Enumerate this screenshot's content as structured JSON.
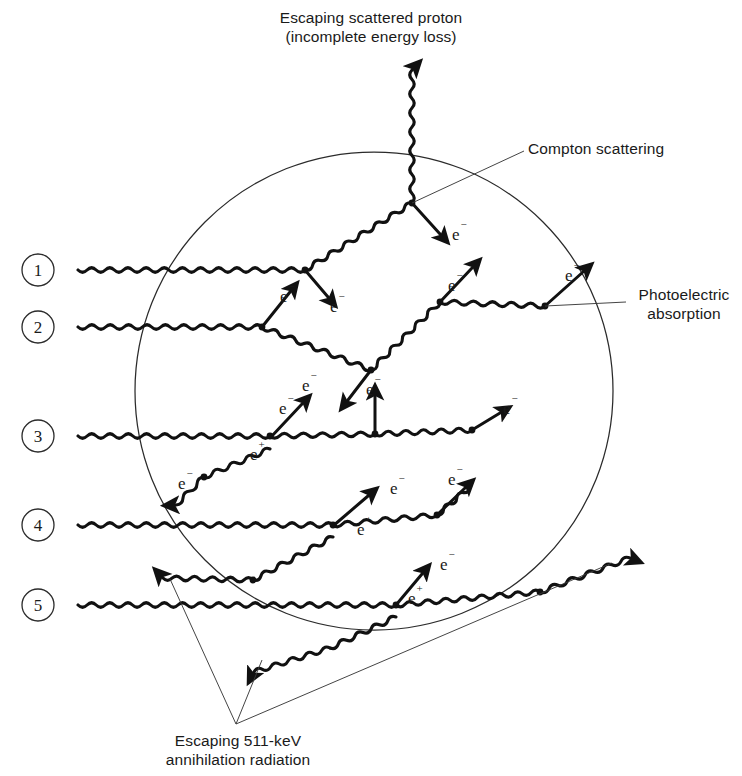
{
  "figure": {
    "detector_shape": "circle",
    "background_color": "#ffffff",
    "ink_color": "#111111"
  },
  "captions": {
    "top": "Escaping scattered proton\n(incomplete energy loss)",
    "compton": "Compton scattering",
    "photoelectric": "Photoelectric\nabsorption",
    "bottom": "Escaping 511-keV\nannihilation radiation"
  },
  "event_numbers": [
    {
      "label": "1",
      "cx": 38,
      "cy": 270
    },
    {
      "label": "2",
      "cx": 38,
      "cy": 327
    },
    {
      "label": "3",
      "cx": 38,
      "cy": 436
    },
    {
      "label": "4",
      "cx": 38,
      "cy": 525
    },
    {
      "label": "5",
      "cx": 38,
      "cy": 605
    }
  ],
  "particle_labels": [
    {
      "text": "e",
      "sup": "−",
      "x": 280,
      "y": 302
    },
    {
      "text": "e",
      "sup": "−",
      "x": 330,
      "y": 312
    },
    {
      "text": "e",
      "sup": "−",
      "x": 452,
      "y": 240
    },
    {
      "text": "e",
      "sup": "−",
      "x": 448,
      "y": 291
    },
    {
      "text": "e",
      "sup": "−",
      "x": 565,
      "y": 281
    },
    {
      "text": "e",
      "sup": "−",
      "x": 302,
      "y": 391
    },
    {
      "text": "e",
      "sup": "−",
      "x": 366,
      "y": 395
    },
    {
      "text": "e",
      "sup": "−",
      "x": 279,
      "y": 414
    },
    {
      "text": "e",
      "sup": "+",
      "x": 250,
      "y": 460
    },
    {
      "text": "e",
      "sup": "−",
      "x": 178,
      "y": 489
    },
    {
      "text": "e",
      "sup": "−",
      "x": 503,
      "y": 414
    },
    {
      "text": "e",
      "sup": "−",
      "x": 390,
      "y": 494
    },
    {
      "text": "e",
      "sup": "+",
      "x": 357,
      "y": 535
    },
    {
      "text": "e",
      "sup": "−",
      "x": 448,
      "y": 485
    },
    {
      "text": "e",
      "sup": "−",
      "x": 440,
      "y": 570
    },
    {
      "text": "e",
      "sup": "+",
      "x": 408,
      "y": 604
    }
  ],
  "detector": {
    "cx": 374,
    "cy": 391,
    "r": 239
  },
  "tracks": {
    "incident_photons": [
      {
        "row": 1,
        "x_start": 78,
        "y": 270,
        "x_end": 305
      },
      {
        "row": 2,
        "x_start": 78,
        "y": 327,
        "x_end": 262
      },
      {
        "row": 3,
        "x_start": 78,
        "y": 436,
        "x_end": 270
      },
      {
        "row": 4,
        "x_start": 78,
        "y": 525,
        "x_end": 333
      },
      {
        "row": 5,
        "x_start": 78,
        "y": 605,
        "x_end": 396
      }
    ],
    "escaping_scattered_photon": {
      "x": 412,
      "y_from": 202,
      "y_to": 70
    },
    "escaping_annihilation_left": {
      "to_x": 163,
      "to_y": 578
    },
    "escaping_annihilation_right": {
      "to_x": 620,
      "to_y": 560
    }
  }
}
